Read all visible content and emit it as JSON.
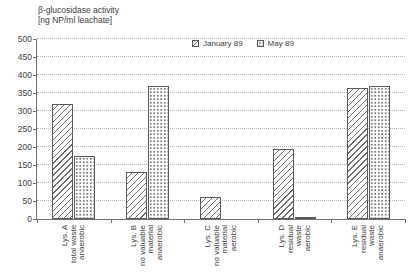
{
  "title": {
    "line1": "β-glucosidase activity",
    "line2": "[ng NP/ml leachate]"
  },
  "legend": {
    "items": [
      {
        "label": "January 89",
        "pattern": "diagonal-hatch"
      },
      {
        "label": "May 89",
        "pattern": "dots"
      }
    ]
  },
  "colors": {
    "text": "#3c3c3c",
    "axis": "#707070",
    "gridline": "#b5b5b5",
    "bar_outline": "#5a5a5a",
    "hatch_stroke": "#6e6e6e",
    "dot_fill": "#7a7a7a",
    "background": "#ffffff"
  },
  "chart_data": {
    "type": "bar",
    "title": "β-glucosidase activity [ng NP/ml leachate]",
    "xlabel": "",
    "ylabel": "ng NP/ml leachate",
    "ylim": [
      0,
      500
    ],
    "ytick_step": 50,
    "grid": "horizontal-dotted",
    "legend_position": "top-inside",
    "categories": [
      {
        "id": "lys-a",
        "lines": [
          "Lys. A",
          "total waste",
          "anaerobic"
        ]
      },
      {
        "id": "lys-b",
        "lines": [
          "Lys. B",
          "no valuable",
          "material",
          "anaerobic"
        ]
      },
      {
        "id": "lys-c",
        "lines": [
          "Lys. C",
          "no valuable",
          "material",
          "aerobic"
        ]
      },
      {
        "id": "lys-d",
        "lines": [
          "Lys. D",
          "residual",
          "waste",
          "aerobic"
        ]
      },
      {
        "id": "lys-e",
        "lines": [
          "Lys. E",
          "residual",
          "waste",
          "anaerobic"
        ]
      }
    ],
    "series": [
      {
        "name": "January 89",
        "pattern": "diagonal-hatch",
        "values": [
          320,
          130,
          62,
          195,
          365
        ]
      },
      {
        "name": "May 89",
        "pattern": "dots",
        "values": [
          175,
          370,
          0,
          6,
          370
        ]
      }
    ]
  }
}
